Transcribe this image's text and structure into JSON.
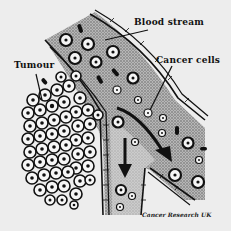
{
  "diagram": {
    "labels": {
      "blood_stream": "Blood stream",
      "cancer_cells": "Cancer cells",
      "tumour": "Tumour"
    },
    "credit": "Cancer Research UK",
    "arrows": [
      {
        "name": "flow-arrow-down",
        "direction": "down"
      },
      {
        "name": "flow-arrow-diagonal",
        "direction": "down-right"
      }
    ],
    "colors": {
      "background": "#ededed",
      "ink": "#111111",
      "vessel_fill": "#9a9a9a",
      "cell_fill": "#f4f4f4"
    }
  }
}
